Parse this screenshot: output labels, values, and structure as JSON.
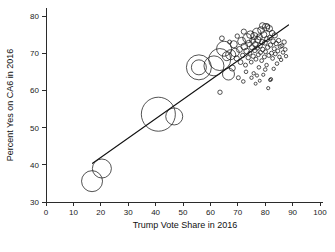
{
  "chart_data": {
    "type": "scatter",
    "title": "",
    "xlabel": "Trump Vote Share in 2016",
    "ylabel": "Percent Yes on CA6 in 2016",
    "xlim": [
      0,
      100
    ],
    "ylim": [
      28,
      82
    ],
    "xticks": [
      0,
      10,
      20,
      30,
      40,
      50,
      60,
      70,
      80,
      90,
      100
    ],
    "yticks": [
      30,
      40,
      50,
      60,
      70,
      80
    ],
    "grid": false,
    "legend": null,
    "marker": "open-circle",
    "encoding": "bubble size encodes population/weight",
    "fit_line": {
      "type": "linear-fit",
      "x_start": 17.0,
      "y_start": 40.4,
      "x_end": 88.5,
      "y_end": 77.6,
      "slope": 0.52,
      "intercept": 31.6
    },
    "points": [
      {
        "x": 16.8,
        "y": 35.6,
        "r": 10.5
      },
      {
        "x": 20.4,
        "y": 39.0,
        "r": 9.5
      },
      {
        "x": 41.0,
        "y": 53.6,
        "r": 17.0
      },
      {
        "x": 46.8,
        "y": 53.0,
        "r": 8.5
      },
      {
        "x": 55.8,
        "y": 66.2,
        "r": 12.5
      },
      {
        "x": 55.8,
        "y": 66.2,
        "r": 7.5
      },
      {
        "x": 61.3,
        "y": 66.6,
        "r": 10.0
      },
      {
        "x": 63.4,
        "y": 68.3,
        "r": 11.0
      },
      {
        "x": 63.5,
        "y": 59.5,
        "r": 2.2
      },
      {
        "x": 65.0,
        "y": 71.2,
        "r": 7.5
      },
      {
        "x": 66.0,
        "y": 69.2,
        "r": 4.5
      },
      {
        "x": 66.6,
        "y": 64.4,
        "r": 6.0
      },
      {
        "x": 67.4,
        "y": 69.6,
        "r": 5.0
      },
      {
        "x": 68.0,
        "y": 66.0,
        "r": 3.0
      },
      {
        "x": 68.5,
        "y": 72.4,
        "r": 3.6
      },
      {
        "x": 69.0,
        "y": 70.2,
        "r": 4.2
      },
      {
        "x": 69.6,
        "y": 68.6,
        "r": 2.6
      },
      {
        "x": 70.2,
        "y": 63.4,
        "r": 2.0
      },
      {
        "x": 70.6,
        "y": 71.0,
        "r": 3.0
      },
      {
        "x": 71.0,
        "y": 67.6,
        "r": 2.4
      },
      {
        "x": 71.4,
        "y": 73.2,
        "r": 4.0
      },
      {
        "x": 71.8,
        "y": 69.4,
        "r": 2.2
      },
      {
        "x": 72.0,
        "y": 62.4,
        "r": 1.8
      },
      {
        "x": 72.4,
        "y": 71.8,
        "r": 3.4
      },
      {
        "x": 72.8,
        "y": 66.8,
        "r": 2.0
      },
      {
        "x": 73.2,
        "y": 70.6,
        "r": 2.8
      },
      {
        "x": 73.5,
        "y": 74.0,
        "r": 4.6
      },
      {
        "x": 73.8,
        "y": 68.8,
        "r": 2.2
      },
      {
        "x": 74.0,
        "y": 72.6,
        "r": 3.2
      },
      {
        "x": 74.4,
        "y": 70.0,
        "r": 2.0
      },
      {
        "x": 74.6,
        "y": 75.0,
        "r": 3.8
      },
      {
        "x": 74.9,
        "y": 67.6,
        "r": 1.9
      },
      {
        "x": 75.2,
        "y": 71.6,
        "r": 2.6
      },
      {
        "x": 75.4,
        "y": 73.4,
        "r": 3.0
      },
      {
        "x": 75.6,
        "y": 69.2,
        "r": 2.2
      },
      {
        "x": 75.8,
        "y": 64.6,
        "r": 1.7
      },
      {
        "x": 76.0,
        "y": 74.6,
        "r": 3.6
      },
      {
        "x": 76.2,
        "y": 70.8,
        "r": 2.4
      },
      {
        "x": 76.4,
        "y": 72.4,
        "r": 2.8
      },
      {
        "x": 76.6,
        "y": 68.4,
        "r": 2.0
      },
      {
        "x": 76.9,
        "y": 75.6,
        "r": 4.2
      },
      {
        "x": 77.1,
        "y": 71.4,
        "r": 2.2
      },
      {
        "x": 77.3,
        "y": 73.6,
        "r": 3.2
      },
      {
        "x": 77.5,
        "y": 69.6,
        "r": 2.0
      },
      {
        "x": 77.7,
        "y": 66.2,
        "r": 1.8
      },
      {
        "x": 77.9,
        "y": 74.4,
        "r": 3.0
      },
      {
        "x": 78.1,
        "y": 72.0,
        "r": 2.4
      },
      {
        "x": 78.3,
        "y": 70.2,
        "r": 2.0
      },
      {
        "x": 78.5,
        "y": 76.2,
        "r": 3.4
      },
      {
        "x": 78.7,
        "y": 68.0,
        "r": 1.9
      },
      {
        "x": 78.9,
        "y": 73.0,
        "r": 2.6
      },
      {
        "x": 79.1,
        "y": 71.0,
        "r": 2.2
      },
      {
        "x": 79.3,
        "y": 64.2,
        "r": 1.6
      },
      {
        "x": 79.5,
        "y": 75.0,
        "r": 3.0
      },
      {
        "x": 79.7,
        "y": 69.0,
        "r": 2.0
      },
      {
        "x": 79.9,
        "y": 72.8,
        "r": 2.4
      },
      {
        "x": 80.1,
        "y": 70.4,
        "r": 2.0
      },
      {
        "x": 80.3,
        "y": 77.0,
        "r": 3.8
      },
      {
        "x": 80.5,
        "y": 66.8,
        "r": 1.8
      },
      {
        "x": 80.7,
        "y": 73.8,
        "r": 2.6
      },
      {
        "x": 80.9,
        "y": 71.6,
        "r": 2.2
      },
      {
        "x": 81.1,
        "y": 60.6,
        "r": 1.6
      },
      {
        "x": 81.3,
        "y": 69.4,
        "r": 2.0
      },
      {
        "x": 81.5,
        "y": 76.6,
        "r": 3.2
      },
      {
        "x": 81.7,
        "y": 74.2,
        "r": 2.4
      },
      {
        "x": 81.9,
        "y": 72.2,
        "r": 2.2
      },
      {
        "x": 82.1,
        "y": 63.0,
        "r": 1.7
      },
      {
        "x": 82.3,
        "y": 70.0,
        "r": 2.0
      },
      {
        "x": 82.5,
        "y": 75.4,
        "r": 2.8
      },
      {
        "x": 82.7,
        "y": 68.6,
        "r": 1.9
      },
      {
        "x": 82.9,
        "y": 73.2,
        "r": 2.4
      },
      {
        "x": 83.1,
        "y": 65.8,
        "r": 1.7
      },
      {
        "x": 83.3,
        "y": 71.2,
        "r": 2.0
      },
      {
        "x": 83.5,
        "y": 74.8,
        "r": 2.6
      },
      {
        "x": 83.7,
        "y": 69.8,
        "r": 1.9
      },
      {
        "x": 84.0,
        "y": 72.6,
        "r": 2.2
      },
      {
        "x": 84.3,
        "y": 67.2,
        "r": 1.8
      },
      {
        "x": 84.6,
        "y": 70.6,
        "r": 2.0
      },
      {
        "x": 84.9,
        "y": 73.4,
        "r": 2.2
      },
      {
        "x": 85.2,
        "y": 69.0,
        "r": 1.8
      },
      {
        "x": 85.5,
        "y": 71.8,
        "r": 2.0
      },
      {
        "x": 85.8,
        "y": 68.2,
        "r": 1.7
      },
      {
        "x": 86.1,
        "y": 72.0,
        "r": 2.0
      },
      {
        "x": 86.5,
        "y": 70.2,
        "r": 1.8
      },
      {
        "x": 86.9,
        "y": 73.0,
        "r": 2.2
      },
      {
        "x": 87.3,
        "y": 71.0,
        "r": 1.9
      },
      {
        "x": 87.6,
        "y": 69.2,
        "r": 1.7
      },
      {
        "x": 64.2,
        "y": 74.0,
        "r": 2.4
      },
      {
        "x": 67.0,
        "y": 73.0,
        "r": 2.0
      },
      {
        "x": 69.8,
        "y": 74.6,
        "r": 2.2
      },
      {
        "x": 72.2,
        "y": 75.8,
        "r": 2.6
      },
      {
        "x": 79.0,
        "y": 77.4,
        "r": 3.0
      },
      {
        "x": 80.8,
        "y": 77.2,
        "r": 2.4
      },
      {
        "x": 73.0,
        "y": 65.0,
        "r": 1.8
      },
      {
        "x": 75.0,
        "y": 63.4,
        "r": 1.7
      },
      {
        "x": 77.0,
        "y": 64.0,
        "r": 1.6
      },
      {
        "x": 80.0,
        "y": 65.6,
        "r": 1.8
      },
      {
        "x": 81.8,
        "y": 62.8,
        "r": 1.6
      },
      {
        "x": 78.0,
        "y": 62.6,
        "r": 1.5
      },
      {
        "x": 76.5,
        "y": 61.8,
        "r": 1.5
      }
    ]
  },
  "axes": {
    "x_title": "Trump Vote Share in 2016",
    "y_title": "Percent Yes on CA6 in 2016",
    "x_tick_labels": [
      "0",
      "10",
      "20",
      "30",
      "40",
      "50",
      "60",
      "70",
      "80",
      "90",
      "100"
    ],
    "y_tick_labels": [
      "30",
      "40",
      "50",
      "60",
      "70",
      "80"
    ]
  },
  "colors": {
    "marker_stroke": "#1b1b1b",
    "fit_line": "#111111",
    "axis": "#2b2b2b",
    "background": "#ffffff"
  }
}
